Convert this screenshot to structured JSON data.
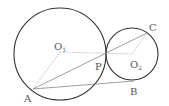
{
  "diagram": {
    "circles": [
      {
        "name": "circle-O1",
        "cx": 60,
        "cy": 54,
        "r": 46
      },
      {
        "name": "circle-O2",
        "cx": 132,
        "cy": 54,
        "r": 26
      }
    ],
    "points": {
      "A": {
        "x": 33,
        "y": 89
      },
      "B": {
        "x": 134,
        "y": 81
      },
      "C": {
        "x": 147,
        "y": 33
      },
      "P": {
        "x": 106,
        "y": 54
      },
      "O1": {
        "x": 60,
        "y": 52
      },
      "O2": {
        "x": 132,
        "y": 54
      }
    },
    "labels": {
      "A": {
        "text": "A",
        "x": 24,
        "y": 102
      },
      "B": {
        "text": "B",
        "x": 130,
        "y": 95
      },
      "C": {
        "text": "C",
        "x": 149,
        "y": 31
      },
      "P": {
        "text": "P",
        "x": 95,
        "y": 70
      },
      "O1": {
        "text": "O",
        "sub": "1",
        "x": 54,
        "y": 50
      },
      "O2": {
        "text": "O",
        "sub": "2",
        "x": 130,
        "y": 68
      }
    },
    "segments_solid": [
      "AB",
      "AC"
    ],
    "segments_dashed": [
      "O1A",
      "O1O2",
      "O2C"
    ]
  }
}
